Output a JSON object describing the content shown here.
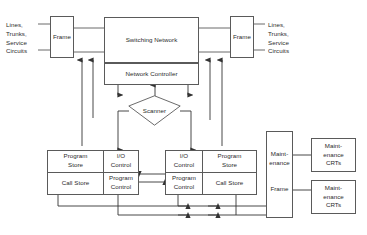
{
  "diagram": {
    "stroke_color": "#5a5a5a",
    "text_color": "#2b2b2b",
    "background": "#ffffff"
  },
  "labels": {
    "left_terminals": "Lines,\nTrunks,\nService\nCircuits",
    "right_terminals": "Lines,\nTrunks,\nService\nCircuits"
  },
  "nodes": {
    "frame_left": "Frame",
    "frame_right": "Frame",
    "switching_network": "Switching Network",
    "network_controller": "Network Controller",
    "scanner": "Scanner",
    "left_block": {
      "program_store": "Program\nStore",
      "io_control": "I/O\nControl",
      "call_store": "Call Store",
      "program_control": "Program\nControl"
    },
    "right_block": {
      "io_control": "I/O\nControl",
      "program_store": "Program\nStore",
      "program_control": "Program\nControl",
      "call_store": "Call Store"
    },
    "maintenance_frame_top": "Maint-\nenance",
    "maintenance_frame_bottom": "Frame",
    "maintenance_crt_top": "Maint-\nenance\nCRTs",
    "maintenance_crt_bottom": "Maint-\nenance\nCRTs"
  }
}
